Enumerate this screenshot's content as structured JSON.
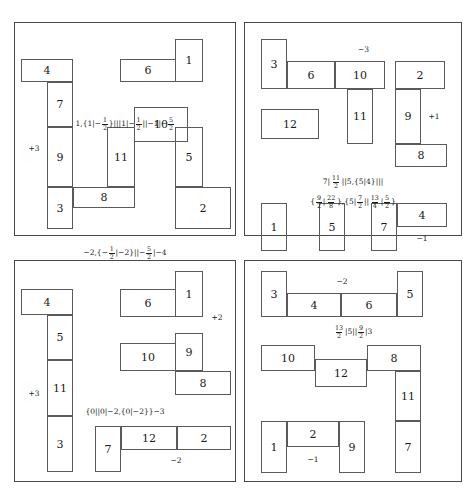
{
  "figure": {
    "type": "combinatorial-game-diagrams",
    "panel_count": 4
  },
  "panels": [
    {
      "id": "panel-top-left",
      "cells": [
        {
          "label": "4",
          "x": 6,
          "y": 36,
          "w": 52,
          "h": 23
        },
        {
          "label": "6",
          "x": 105,
          "y": 36,
          "w": 56,
          "h": 23
        },
        {
          "label": "1",
          "x": 160,
          "y": 16,
          "w": 28,
          "h": 43
        },
        {
          "label": "7",
          "x": 32,
          "y": 59,
          "w": 26,
          "h": 45
        },
        {
          "label": "10",
          "x": 119,
          "y": 84,
          "w": 54,
          "h": 35
        },
        {
          "label": "11",
          "x": 92,
          "y": 104,
          "w": 28,
          "h": 60
        },
        {
          "label": "5",
          "x": 160,
          "y": 104,
          "w": 28,
          "h": 60
        },
        {
          "label": "9",
          "x": 32,
          "y": 104,
          "w": 26,
          "h": 60
        },
        {
          "label": "+3",
          "x": 6,
          "y": 59,
          "w": 26,
          "h": 133,
          "free": true
        },
        {
          "label": "8",
          "x": 58,
          "y": 164,
          "w": 62,
          "h": 21
        },
        {
          "label": "2",
          "x": 160,
          "y": 164,
          "w": 56,
          "h": 42
        },
        {
          "label": "3",
          "x": 32,
          "y": 164,
          "w": 26,
          "h": 42
        }
      ],
      "formulas": [
        {
          "text": "1,{1|-1/2}|||1|-1/2||-1|-5/2",
          "y": 94
        },
        {
          "text": "-2,{-1/2|-2}||-5/2|-4",
          "y": 223
        }
      ]
    },
    {
      "id": "panel-top-right",
      "cells": [
        {
          "label": "3",
          "x": 16,
          "y": 16,
          "w": 26,
          "h": 50
        },
        {
          "label": "-3",
          "x": 42,
          "y": 16,
          "w": 153,
          "h": 22,
          "free": true
        },
        {
          "label": "6",
          "x": 42,
          "y": 38,
          "w": 48,
          "h": 28
        },
        {
          "label": "10",
          "x": 90,
          "y": 38,
          "w": 50,
          "h": 28
        },
        {
          "label": "2",
          "x": 150,
          "y": 38,
          "w": 50,
          "h": 28
        },
        {
          "label": "11",
          "x": 102,
          "y": 66,
          "w": 26,
          "h": 55
        },
        {
          "label": "9",
          "x": 150,
          "y": 66,
          "w": 26,
          "h": 55
        },
        {
          "label": "+1",
          "x": 176,
          "y": 66,
          "w": 26,
          "h": 55,
          "free": true
        },
        {
          "label": "12",
          "x": 16,
          "y": 86,
          "w": 58,
          "h": 30
        },
        {
          "label": "8",
          "x": 150,
          "y": 121,
          "w": 52,
          "h": 23
        },
        {
          "label": "1",
          "x": 16,
          "y": 180,
          "w": 26,
          "h": 48
        },
        {
          "label": "5",
          "x": 74,
          "y": 180,
          "w": 26,
          "h": 48
        },
        {
          "label": "7",
          "x": 126,
          "y": 180,
          "w": 26,
          "h": 48
        },
        {
          "label": "4",
          "x": 152,
          "y": 180,
          "w": 50,
          "h": 24
        },
        {
          "label": "-1",
          "x": 152,
          "y": 204,
          "w": 50,
          "h": 24,
          "free": true
        }
      ],
      "formulas": [
        {
          "text": "7|11/2||5,{5|4}|||",
          "y": 152
        },
        {
          "text": "{9/2|22/8},{5|7/2||13/4|5/2}",
          "y": 172
        }
      ]
    },
    {
      "id": "panel-bottom-left",
      "cells": [
        {
          "label": "4",
          "x": 6,
          "y": 28,
          "w": 52,
          "h": 26
        },
        {
          "label": "6",
          "x": 105,
          "y": 28,
          "w": 56,
          "h": 28
        },
        {
          "label": "1",
          "x": 160,
          "y": 10,
          "w": 28,
          "h": 46
        },
        {
          "label": "5",
          "x": 32,
          "y": 54,
          "w": 26,
          "h": 45
        },
        {
          "label": "+2",
          "x": 188,
          "y": 44,
          "w": 28,
          "h": 26,
          "free": true
        },
        {
          "label": "10",
          "x": 105,
          "y": 82,
          "w": 56,
          "h": 28
        },
        {
          "label": "9",
          "x": 160,
          "y": 72,
          "w": 28,
          "h": 38
        },
        {
          "label": "11",
          "x": 32,
          "y": 99,
          "w": 26,
          "h": 56
        },
        {
          "label": "+3",
          "x": 6,
          "y": 54,
          "w": 26,
          "h": 157,
          "free": true
        },
        {
          "label": "8",
          "x": 160,
          "y": 110,
          "w": 56,
          "h": 24
        },
        {
          "label": "3",
          "x": 32,
          "y": 155,
          "w": 26,
          "h": 56
        },
        {
          "label": "7",
          "x": 80,
          "y": 165,
          "w": 26,
          "h": 46
        },
        {
          "label": "12",
          "x": 106,
          "y": 165,
          "w": 56,
          "h": 24
        },
        {
          "label": "2",
          "x": 162,
          "y": 165,
          "w": 54,
          "h": 24
        },
        {
          "label": "-2",
          "x": 106,
          "y": 189,
          "w": 110,
          "h": 22,
          "free": true
        }
      ],
      "formulas": [
        {
          "text": "{0||0|-2,{0|-2}}-3",
          "y": 147
        }
      ]
    },
    {
      "id": "panel-bottom-right",
      "cells": [
        {
          "label": "3",
          "x": 16,
          "y": 10,
          "w": 26,
          "h": 46
        },
        {
          "label": "-2",
          "x": 42,
          "y": 10,
          "w": 110,
          "h": 22,
          "free": true
        },
        {
          "label": "4",
          "x": 42,
          "y": 32,
          "w": 54,
          "h": 24
        },
        {
          "label": "6",
          "x": 96,
          "y": 32,
          "w": 56,
          "h": 24
        },
        {
          "label": "5",
          "x": 152,
          "y": 10,
          "w": 26,
          "h": 46
        },
        {
          "label": "10",
          "x": 16,
          "y": 84,
          "w": 54,
          "h": 26
        },
        {
          "label": "12",
          "x": 70,
          "y": 98,
          "w": 52,
          "h": 28
        },
        {
          "label": "8",
          "x": 122,
          "y": 84,
          "w": 54,
          "h": 26
        },
        {
          "label": "11",
          "x": 150,
          "y": 110,
          "w": 26,
          "h": 50
        },
        {
          "label": "1",
          "x": 16,
          "y": 160,
          "w": 26,
          "h": 52
        },
        {
          "label": "2",
          "x": 42,
          "y": 160,
          "w": 52,
          "h": 26
        },
        {
          "label": "-1",
          "x": 42,
          "y": 186,
          "w": 52,
          "h": 26,
          "free": true
        },
        {
          "label": "9",
          "x": 94,
          "y": 160,
          "w": 26,
          "h": 52
        },
        {
          "label": "7",
          "x": 150,
          "y": 160,
          "w": 26,
          "h": 52
        }
      ],
      "formulas": [
        {
          "text": "13/2|5||9/2|3",
          "y": 64
        }
      ]
    }
  ]
}
